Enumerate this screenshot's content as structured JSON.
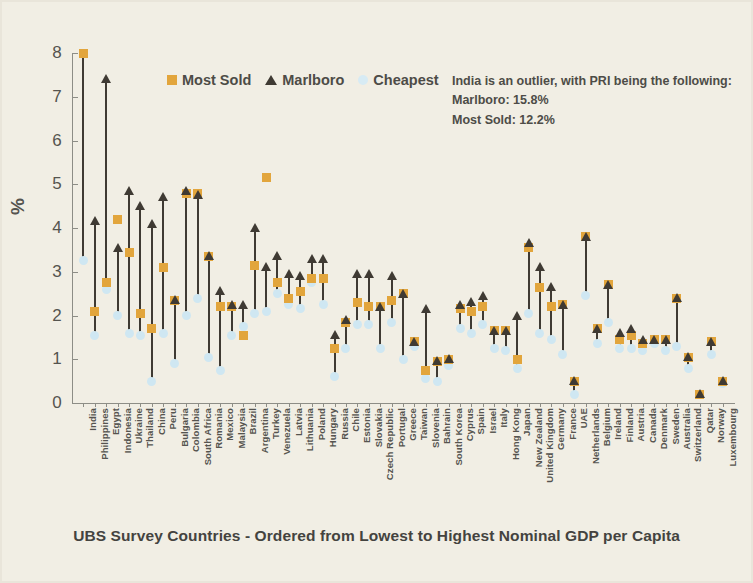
{
  "chart_data": {
    "type": "range-scatter",
    "title": "",
    "xlabel": "UBS Survey Countries - Ordered from Lowest to Highest Nominal GDP per Capita",
    "ylabel": "%",
    "ylim": [
      0,
      8
    ],
    "yticks": [
      0,
      1,
      2,
      3,
      4,
      5,
      6,
      7,
      8
    ],
    "grid": false,
    "legend_position": "top-left-inside",
    "categories": [
      "India",
      "Philippines",
      "Egypt",
      "Indonesia",
      "Ukraine",
      "Thailand",
      "China",
      "Peru",
      "Bulgaria",
      "Colombia",
      "South Africa",
      "Romania",
      "Mexico",
      "Malaysia",
      "Brazil",
      "Argentina",
      "Turkey",
      "Venezuela",
      "Latvia",
      "Lithuania",
      "Poland",
      "Hungary",
      "Russia",
      "Chile",
      "Estonia",
      "Slovakia",
      "Czech Republic",
      "Portugal",
      "Greece",
      "Taiwan",
      "Slovenia",
      "Bahrain",
      "South Korea",
      "Cyprus",
      "Spain",
      "Israel",
      "Italy",
      "Hong Kong",
      "Japan",
      "New Zealand",
      "United Kingdom",
      "Germany",
      "France",
      "UAE",
      "Netherlands",
      "Belgium",
      "Ireland",
      "Finland",
      "Austria",
      "Canada",
      "Denmark",
      "Sweden",
      "Australia",
      "Switzerland",
      "Qatar",
      "Norway",
      "Luxembourg"
    ],
    "series": [
      {
        "name": "Marlboro",
        "marker": "triangle",
        "color": "#3f3a33",
        "values": [
          15.8,
          4.15,
          7.4,
          3.55,
          4.85,
          4.5,
          4.1,
          4.7,
          2.35,
          4.85,
          4.75,
          3.35,
          2.55,
          2.25,
          2.25,
          4.0,
          3.1,
          3.35,
          2.95,
          2.9,
          3.3,
          3.3,
          1.55,
          1.9,
          2.95,
          2.95,
          2.2,
          2.9,
          2.5,
          1.4,
          2.15,
          0.95,
          1.0,
          2.25,
          2.3,
          2.45,
          1.65,
          1.65,
          2.0,
          3.65,
          3.1,
          2.65,
          2.25,
          0.5,
          3.8,
          1.7,
          2.7,
          1.6,
          1.7,
          1.45,
          1.45,
          1.45,
          2.4,
          1.05,
          0.2,
          1.4,
          0.5
        ]
      },
      {
        "name": "Most Sold",
        "marker": "square",
        "color": "#e2a53c",
        "values": [
          12.2,
          2.1,
          2.75,
          4.2,
          3.45,
          2.05,
          1.7,
          3.1,
          2.35,
          4.8,
          4.8,
          3.35,
          2.2,
          2.2,
          1.55,
          3.15,
          5.15,
          2.75,
          2.4,
          2.55,
          2.85,
          2.85,
          1.25,
          1.85,
          2.3,
          2.2,
          2.2,
          2.35,
          2.5,
          1.4,
          0.75,
          0.95,
          1.0,
          2.15,
          2.1,
          2.2,
          1.65,
          1.65,
          1.0,
          3.55,
          2.65,
          2.2,
          2.25,
          0.5,
          3.8,
          1.7,
          2.7,
          1.45,
          1.55,
          1.35,
          1.45,
          1.45,
          2.4,
          1.05,
          0.2,
          1.4,
          0.5
        ]
      },
      {
        "name": "Cheapest",
        "marker": "circle",
        "color": "#cfe7f2",
        "values": [
          3.25,
          1.55,
          2.6,
          2.0,
          1.6,
          1.55,
          0.5,
          1.6,
          0.9,
          2.0,
          2.4,
          1.05,
          0.75,
          1.55,
          1.75,
          2.05,
          2.1,
          2.5,
          2.25,
          2.15,
          2.75,
          2.25,
          0.6,
          1.25,
          1.8,
          1.8,
          1.25,
          1.85,
          1.0,
          1.3,
          0.55,
          0.5,
          0.85,
          1.7,
          1.6,
          1.8,
          1.25,
          1.2,
          0.8,
          2.05,
          1.6,
          1.45,
          1.1,
          0.2,
          2.45,
          1.35,
          1.85,
          1.25,
          1.25,
          1.2,
          1.35,
          1.2,
          1.3,
          0.8,
          0.2,
          1.1,
          0.45
        ]
      }
    ],
    "annotation": {
      "line1": "India is an outlier, with PRI being the following:",
      "line2": "Marlboro: 15.8%",
      "line3": "Most Sold: 12.2%"
    }
  },
  "legend": {
    "items": [
      {
        "label": "Most Sold",
        "marker": "square"
      },
      {
        "label": "Marlboro",
        "marker": "triangle"
      },
      {
        "label": "Cheapest",
        "marker": "circle"
      }
    ]
  },
  "colors": {
    "most_sold": "#e2a53c",
    "marlboro": "#3f3a33",
    "cheapest": "#cfe7f2",
    "background": "#f1eee4",
    "axis": "#8d8d86",
    "text": "#55544f"
  }
}
